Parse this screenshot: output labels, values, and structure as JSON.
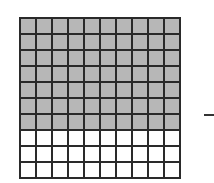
{
  "diagram": {
    "type": "hundred-grid",
    "rows": 10,
    "columns": 10,
    "shaded_rows": 7,
    "shaded_cells": 70,
    "total_cells": 100,
    "colors": {
      "shaded": "#b7b7b7",
      "empty": "#ffffff",
      "gridline": "#2a2a2a"
    },
    "side_mark": "dash"
  }
}
